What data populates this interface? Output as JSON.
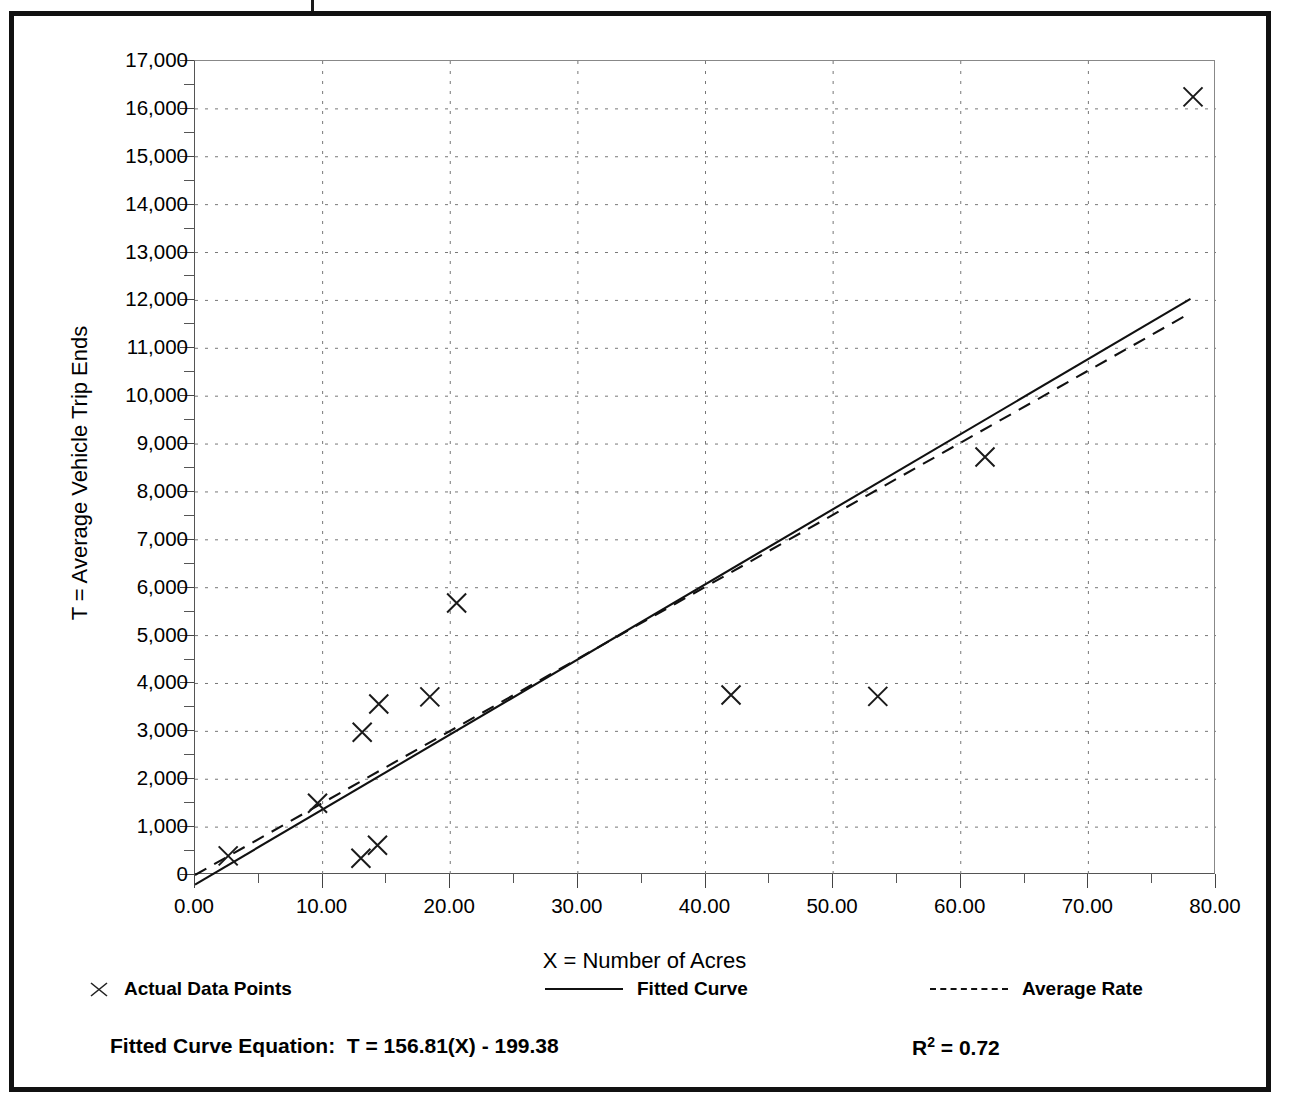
{
  "chart_data": {
    "type": "scatter",
    "title": "",
    "xlabel": "X = Number of Acres",
    "ylabel": "T = Average Vehicle Trip Ends",
    "xlim": [
      0,
      80
    ],
    "ylim": [
      0,
      17000
    ],
    "x_tick_step": 10,
    "y_tick_step": 1000,
    "x_minor_step": 5,
    "y_minor_step": 500,
    "grid": true,
    "grid_style": "dotted",
    "legend_position": "below-plot",
    "x_ticks": [
      "0.00",
      "10.00",
      "20.00",
      "30.00",
      "40.00",
      "50.00",
      "60.00",
      "70.00",
      "80.00"
    ],
    "y_ticks": [
      "0",
      "1,000",
      "2,000",
      "3,000",
      "4,000",
      "5,000",
      "6,000",
      "7,000",
      "8,000",
      "9,000",
      "10,000",
      "11,000",
      "12,000",
      "13,000",
      "14,000",
      "15,000",
      "16,000",
      "17,000"
    ],
    "series": [
      {
        "name": "Actual Data Points",
        "type": "scatter",
        "marker": "x",
        "points": [
          {
            "x": 2.6,
            "y": 400
          },
          {
            "x": 9.6,
            "y": 1500
          },
          {
            "x": 13.0,
            "y": 350
          },
          {
            "x": 13.1,
            "y": 2980
          },
          {
            "x": 14.3,
            "y": 620
          },
          {
            "x": 14.4,
            "y": 3570
          },
          {
            "x": 18.4,
            "y": 3720
          },
          {
            "x": 20.5,
            "y": 5680
          },
          {
            "x": 42.0,
            "y": 3760
          },
          {
            "x": 53.5,
            "y": 3730
          },
          {
            "x": 61.9,
            "y": 8730
          },
          {
            "x": 78.2,
            "y": 16250
          }
        ]
      },
      {
        "name": "Fitted Curve",
        "type": "line",
        "style": "solid",
        "equation": "T = 156.81(X) - 199.38",
        "slope": 156.81,
        "intercept": -199.38,
        "endpoints": [
          {
            "x": 0,
            "y": -199.38
          },
          {
            "x": 78.0,
            "y": 12031
          }
        ]
      },
      {
        "name": "Average Rate",
        "type": "line",
        "style": "dashed",
        "slope": 150.5,
        "intercept": 0,
        "endpoints": [
          {
            "x": 0,
            "y": 0
          },
          {
            "x": 78.0,
            "y": 11739
          }
        ]
      }
    ],
    "annotations": [
      {
        "name": "fitted-curve-equation",
        "text": "Fitted Curve Equation:  T = 156.81(X) - 199.38"
      },
      {
        "name": "r-squared",
        "text": "R² = 0.72",
        "value": 0.72
      }
    ]
  },
  "legend": {
    "items": [
      {
        "label": "Actual Data Points",
        "marker": "x-marker"
      },
      {
        "label": "Fitted Curve",
        "marker": "solid-line"
      },
      {
        "label": "Average Rate",
        "marker": "dashed-line"
      }
    ]
  },
  "footer": {
    "equation_label": "Fitted Curve Equation:  T = 156.81(X) - 199.38",
    "r_squared_prefix": "R",
    "r_squared_exponent": "2",
    "r_squared_value": " = 0.72"
  },
  "colors": {
    "frame": "#111111",
    "ink": "#000000",
    "grid": "#777777",
    "axis": "#555555",
    "background": "#ffffff"
  }
}
